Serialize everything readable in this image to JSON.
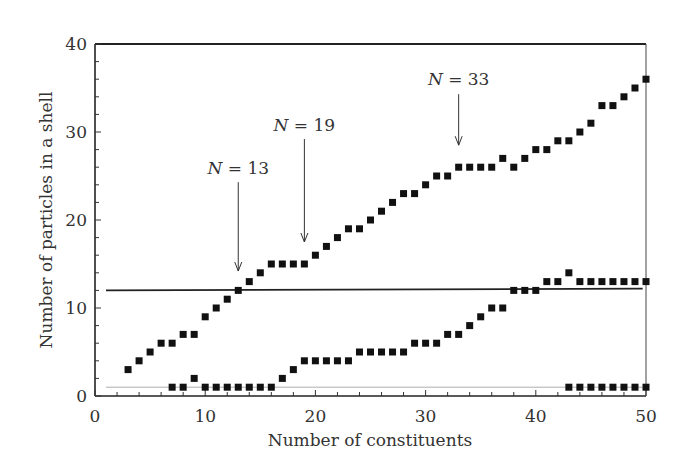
{
  "chart_data": {
    "type": "scatter",
    "title": "",
    "xlabel": "Number of constituents",
    "ylabel": "Number of particles in a shell",
    "xlim": [
      0,
      50
    ],
    "ylim": [
      0,
      40
    ],
    "x_ticks": [
      0,
      10,
      20,
      30,
      40,
      50
    ],
    "y_ticks": [
      0,
      10,
      20,
      30,
      40
    ],
    "grid": false,
    "legend": null,
    "marker": "square",
    "marker_color": "#111111",
    "series": [
      {
        "name": "outer shell",
        "x": [
          3,
          4,
          5,
          6,
          7,
          8,
          9,
          10,
          11,
          12,
          13,
          14,
          15,
          16,
          17,
          18,
          19,
          20,
          21,
          22,
          23,
          24,
          25,
          26,
          27,
          28,
          29,
          30,
          31,
          32,
          33,
          34,
          35,
          36,
          37,
          38,
          39,
          40,
          41,
          42,
          43,
          44,
          45,
          46,
          47,
          48,
          49,
          50
        ],
        "y": [
          3,
          4,
          5,
          6,
          6,
          7,
          7,
          9,
          10,
          11,
          12,
          13,
          14,
          15,
          15,
          15,
          15,
          16,
          17,
          18,
          19,
          19,
          20,
          21,
          22,
          23,
          23,
          24,
          25,
          25,
          26,
          26,
          26,
          26,
          27,
          26,
          27,
          28,
          28,
          29,
          29,
          30,
          31,
          33,
          33,
          34,
          35,
          36
        ]
      },
      {
        "name": "second shell",
        "x": [
          7,
          8,
          9,
          10,
          11,
          12,
          13,
          14,
          15,
          16,
          17,
          18,
          19,
          20,
          21,
          22,
          23,
          24,
          25,
          26,
          27,
          28,
          29,
          30,
          31,
          32,
          33,
          34,
          35,
          36,
          37,
          38,
          39,
          40,
          41,
          42,
          43,
          44,
          45,
          46,
          47,
          48,
          49,
          50
        ],
        "y": [
          1,
          1,
          2,
          1,
          1,
          1,
          1,
          1,
          1,
          1,
          2,
          3,
          4,
          4,
          4,
          4,
          4,
          5,
          5,
          5,
          5,
          5,
          6,
          6,
          6,
          7,
          7,
          8,
          9,
          10,
          10,
          12,
          12,
          12,
          13,
          13,
          14,
          13,
          13,
          13,
          13,
          13,
          13,
          13
        ]
      },
      {
        "name": "third shell",
        "x": [
          43,
          44,
          45,
          46,
          47,
          48,
          49,
          50
        ],
        "y": [
          1,
          1,
          1,
          1,
          1,
          1,
          1,
          1
        ]
      }
    ],
    "reference_lines": [
      {
        "name": "thick reference line",
        "y_start": 12,
        "y_end": 12.2,
        "x_start": 1,
        "x_end": 49.7,
        "color": "#222222",
        "width": 1.8
      },
      {
        "name": "thin reference line",
        "y_start": 1,
        "y_end": 1,
        "x_start": 1,
        "x_end": 49.7,
        "color": "#999999",
        "width": 0.8
      }
    ],
    "annotations": [
      {
        "label_italic": "N",
        "label_rest": " = 13",
        "x": 13,
        "arrow_from_y": 24.3,
        "arrow_to_y": 14.2,
        "text_y": 25.2
      },
      {
        "label_italic": "N",
        "label_rest": " = 19",
        "x": 19,
        "arrow_from_y": 29.2,
        "arrow_to_y": 17.5,
        "text_y": 30.1
      },
      {
        "label_italic": "N",
        "label_rest": " = 33",
        "x": 33,
        "arrow_from_y": 34.3,
        "arrow_to_y": 28.5,
        "text_y": 35.3
      }
    ]
  }
}
